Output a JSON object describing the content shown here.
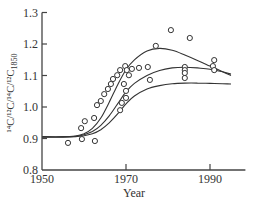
{
  "chart_data": {
    "type": "scatter",
    "title": "",
    "xlabel": "Year",
    "ylabel": "14C/12C / 14C/12C 1850",
    "ylabel_parts": {
      "main": "¹⁴C/¹²C/¹⁴C/¹²C",
      "subscript": "1850"
    },
    "xlim": [
      1950,
      1997
    ],
    "ylim": [
      0.8,
      1.3
    ],
    "grid": false,
    "legend": null,
    "x_ticks": [
      1950,
      1970,
      1990
    ],
    "x_tick_labels": [
      "1950",
      "1970",
      "1990"
    ],
    "y_ticks": [
      0.8,
      0.9,
      1.0,
      1.1,
      1.2,
      1.3
    ],
    "y_tick_labels": [
      "0.8",
      "0.9",
      "1.0",
      "1.1",
      "1.2",
      "1.3"
    ],
    "series": [
      {
        "name": "observations",
        "kind": "scatter",
        "marker": "open-circle",
        "x": [
          1956.2,
          1959.5,
          1962.6,
          1959.3,
          1960.2,
          1962.4,
          1963.1,
          1964.0,
          1964.8,
          1965.7,
          1966.4,
          1966.9,
          1967.9,
          1968.6,
          1969.8,
          1970.2,
          1970.7,
          1969.5,
          1970.0,
          1970.0,
          1969.0,
          1968.6,
          1971.4,
          1973.1,
          1975.2,
          1975.7,
          1977.1,
          1980.7,
          1985.2,
          1984.0,
          1984.0,
          1984.0,
          1984.0,
          1991.0,
          1990.7,
          1991.0
        ],
        "y": [
          0.886,
          0.898,
          0.892,
          0.933,
          0.955,
          0.965,
          1.006,
          1.019,
          1.041,
          1.057,
          1.073,
          1.089,
          1.101,
          1.117,
          1.13,
          1.117,
          1.101,
          1.073,
          1.051,
          1.029,
          1.013,
          0.99,
          1.121,
          1.124,
          1.127,
          1.086,
          1.194,
          1.244,
          1.219,
          1.127,
          1.117,
          1.108,
          1.092,
          1.149,
          1.13,
          1.117
        ]
      },
      {
        "name": "model-upper",
        "kind": "line",
        "x": [
          1950,
          1955,
          1958,
          1960,
          1962,
          1964,
          1966,
          1968,
          1970,
          1972,
          1975,
          1978,
          1981,
          1984,
          1987,
          1990,
          1993,
          1995
        ],
        "y": [
          0.905,
          0.905,
          0.908,
          0.915,
          0.932,
          0.965,
          1.015,
          1.07,
          1.118,
          1.15,
          1.178,
          1.186,
          1.18,
          1.165,
          1.148,
          1.13,
          1.112,
          1.1
        ]
      },
      {
        "name": "model-middle",
        "kind": "line",
        "x": [
          1950,
          1955,
          1958,
          1960,
          1962,
          1964,
          1966,
          1968,
          1970,
          1972,
          1975,
          1978,
          1981,
          1984,
          1987,
          1990,
          1993,
          1995
        ],
        "y": [
          0.905,
          0.905,
          0.907,
          0.912,
          0.922,
          0.942,
          0.972,
          1.01,
          1.048,
          1.075,
          1.1,
          1.116,
          1.124,
          1.126,
          1.124,
          1.12,
          1.112,
          1.104
        ]
      },
      {
        "name": "model-lower",
        "kind": "line",
        "x": [
          1950,
          1955,
          1958,
          1960,
          1962,
          1964,
          1966,
          1968,
          1970,
          1972,
          1975,
          1978,
          1981,
          1984,
          1987,
          1990,
          1993,
          1995
        ],
        "y": [
          0.905,
          0.905,
          0.906,
          0.909,
          0.915,
          0.928,
          0.95,
          0.978,
          1.01,
          1.035,
          1.057,
          1.068,
          1.074,
          1.076,
          1.076,
          1.075,
          1.074,
          1.073
        ]
      }
    ]
  },
  "colors": {
    "axis": "#444444",
    "line": "#333333",
    "marker": "#333333",
    "background": "#ffffff"
  }
}
